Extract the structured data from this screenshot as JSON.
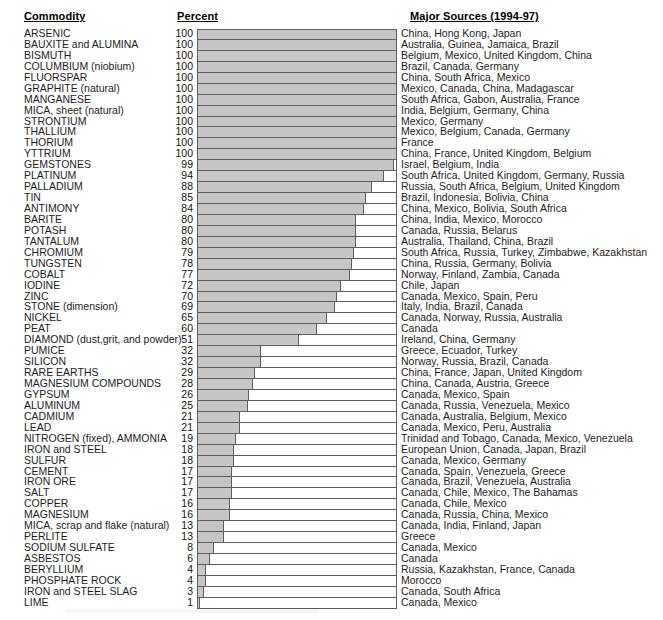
{
  "headers": {
    "commodity": "Commodity",
    "percent": "Percent",
    "sources": "Major Sources (1994-97)"
  },
  "chart_data": {
    "type": "bar",
    "orientation": "horizontal",
    "xlabel": "Percent",
    "ylabel": "Commodity",
    "xlim": [
      0,
      100
    ],
    "grid": false,
    "legend": false,
    "bar_color": "#c6c6c6",
    "bar_border_color": "#5d5d5d",
    "categories": [
      "ARSENIC",
      "BAUXITE and ALUMINA",
      "BISMUTH",
      "COLUMBIUM (niobium)",
      "FLUORSPAR",
      "GRAPHITE (natural)",
      "MANGANESE",
      "MICA, sheet (natural)",
      "STRONTIUM",
      "THALLIUM",
      "THORIUM",
      "YTTRIUM",
      "GEMSTONES",
      "PLATINUM",
      "PALLADIUM",
      "TIN",
      "ANTIMONY",
      "BARITE",
      "POTASH",
      "TANTALUM",
      "CHROMIUM",
      "TUNGSTEN",
      "COBALT",
      "IODINE",
      "ZINC",
      "STONE (dimension)",
      "NICKEL",
      "PEAT",
      "DIAMOND (dust,grit, and powder)",
      "PUMICE",
      "SILICON",
      "RARE EARTHS",
      "MAGNESIUM COMPOUNDS",
      "GYPSUM",
      "ALUMINUM",
      "CADMIUM",
      "LEAD",
      "NITROGEN (fixed), AMMONIA",
      "IRON and STEEL",
      "SULFUR",
      "CEMENT",
      "IRON ORE",
      "SALT",
      "COPPER",
      "MAGNESIUM",
      "MICA, scrap and flake (natural)",
      "PERLITE",
      "SODIUM SULFATE",
      "ASBESTOS",
      "BERYLLIUM",
      "PHOSPHATE ROCK",
      "IRON and STEEL SLAG",
      "LIME"
    ],
    "values": [
      100,
      100,
      100,
      100,
      100,
      100,
      100,
      100,
      100,
      100,
      100,
      100,
      99,
      94,
      88,
      85,
      84,
      80,
      80,
      80,
      79,
      78,
      77,
      72,
      70,
      69,
      65,
      60,
      51,
      32,
      32,
      29,
      28,
      26,
      25,
      21,
      21,
      19,
      18,
      18,
      17,
      17,
      17,
      16,
      16,
      13,
      13,
      8,
      6,
      4,
      4,
      3,
      1
    ],
    "sources": [
      "China, Hong Kong, Japan",
      "Australia, Guinea, Jamaica, Brazil",
      "Belgium, Mexico, United Kingdom, China",
      "Brazil, Canada, Germany",
      "China, South Africa, Mexico",
      "Mexico, Canada, China, Madagascar",
      "South Africa, Gabon, Australia, France",
      "India, Belgium, Germany, China",
      "Mexico, Germany",
      "Mexico, Belgium, Canada, Germany",
      "France",
      "China, France, United Kingdom, Belgium",
      "Israel, Belgium, India",
      "South Africa, United Kingdom, Germany, Russia",
      "Russia, South Africa, Belgium, United Kingdom",
      "Brazil, Indonesia, Bolivia, China",
      "China, Mexico, Bolivia, South Africa",
      "China, India, Mexico, Morocco",
      "Canada, Russia, Belarus",
      "Australia, Thailand, China, Brazil",
      "South Africa, Russia, Turkey, Zimbabwe, Kazakhstan",
      "China, Russia, Germany, Bolivia",
      "Norway, Finland, Zambia, Canada",
      "Chile, Japan",
      "Canada, Mexico, Spain, Peru",
      "Italy, India, Brazil, Canada",
      "Canada, Norway, Russia, Australia",
      "Canada",
      "Ireland, China, Germany",
      "Greece, Ecuador, Turkey",
      "Norway, Russia, Brazil, Canada",
      "China, France, Japan, United Kingdom",
      "China, Canada, Austria, Greece",
      "Canada, Mexico, Spain",
      "Canada, Russia, Venezuela, Mexico",
      "Canada, Australia, Belgium, Mexico",
      "Canada, Mexico, Peru, Australia",
      "Trinidad and Tobago, Canada, Mexico, Venezuela",
      "European Union, Canada, Japan, Brazil",
      "Canada, Mexico, Germany",
      "Canada, Spain, Venezuela, Greece",
      "Canada, Brazil, Venezuela, Australia",
      "Canada, Chile, Mexico, The Bahamas",
      "Canada, Chile, Mexico",
      "Canada, Russia, China, Mexico",
      "Canada, India, Finland, Japan",
      "Greece",
      "Canada, Mexico",
      "Canada",
      "Russia, Kazakhstan, France, Canada",
      "Morocco",
      "Canada, South Africa",
      "Canada, Mexico"
    ]
  }
}
